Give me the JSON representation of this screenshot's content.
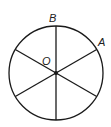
{
  "diagram": {
    "type": "circle-with-six-radii",
    "center_label": "O",
    "point_labels": [
      "A",
      "B"
    ],
    "labels": {
      "center": "O",
      "top": "B",
      "upper_right": "A"
    },
    "circle": {
      "cx": 56,
      "cy": 73,
      "r": 47
    },
    "radii_angles_deg": [
      90,
      30,
      150,
      210,
      270,
      330
    ],
    "stroke_color": "#1a1a1a"
  }
}
